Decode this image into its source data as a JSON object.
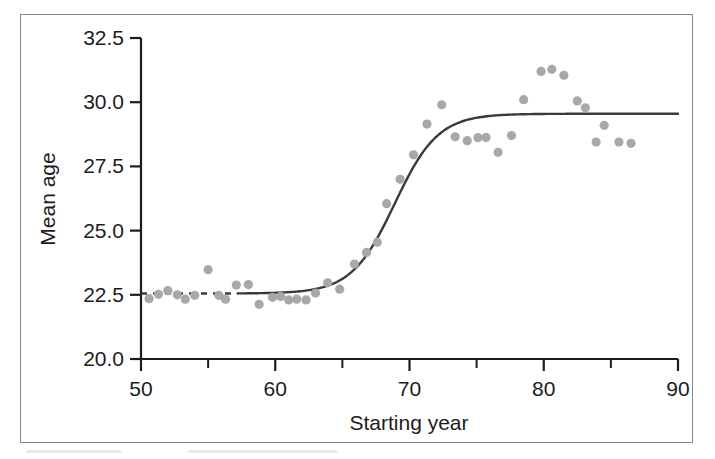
{
  "chart_data": {
    "type": "scatter",
    "title": "",
    "xlabel": "Starting year",
    "ylabel": "Mean age",
    "xlim": [
      50,
      90
    ],
    "ylim": [
      20.0,
      32.5
    ],
    "grid": false,
    "legend": "none",
    "x_ticks": [
      50,
      60,
      70,
      80,
      90
    ],
    "x_tick_labels": [
      "50",
      "60",
      "70",
      "80",
      "90"
    ],
    "x_minor_ticks": [
      55,
      65,
      75,
      85
    ],
    "y_ticks": [
      20.0,
      22.5,
      25.0,
      27.5,
      30.0,
      32.5
    ],
    "y_tick_labels": [
      "20.0",
      "22.5",
      "25.0",
      "27.5",
      "30.0",
      "32.5"
    ],
    "point_color": "#a8a8a8",
    "curve_color": "#3a3a3a",
    "axis_color": "#1c1c1c",
    "series": [
      {
        "name": "Mean age at observation",
        "type": "scatter",
        "points": [
          {
            "x": 50.6,
            "y": 22.35
          },
          {
            "x": 51.3,
            "y": 22.52
          },
          {
            "x": 52.0,
            "y": 22.66
          },
          {
            "x": 52.7,
            "y": 22.5
          },
          {
            "x": 53.3,
            "y": 22.33
          },
          {
            "x": 54.0,
            "y": 22.48
          },
          {
            "x": 55.0,
            "y": 23.48
          },
          {
            "x": 55.8,
            "y": 22.48
          },
          {
            "x": 56.3,
            "y": 22.33
          },
          {
            "x": 57.1,
            "y": 22.88
          },
          {
            "x": 58.0,
            "y": 22.9
          },
          {
            "x": 58.8,
            "y": 22.13
          },
          {
            "x": 59.8,
            "y": 22.4
          },
          {
            "x": 60.4,
            "y": 22.43
          },
          {
            "x": 61.0,
            "y": 22.3
          },
          {
            "x": 61.6,
            "y": 22.33
          },
          {
            "x": 62.3,
            "y": 22.3
          },
          {
            "x": 63.0,
            "y": 22.57
          },
          {
            "x": 63.9,
            "y": 22.97
          },
          {
            "x": 64.8,
            "y": 22.72
          },
          {
            "x": 65.9,
            "y": 23.7
          },
          {
            "x": 66.8,
            "y": 24.15
          },
          {
            "x": 67.6,
            "y": 24.55
          },
          {
            "x": 68.3,
            "y": 26.05
          },
          {
            "x": 69.3,
            "y": 27.0
          },
          {
            "x": 70.3,
            "y": 27.95
          },
          {
            "x": 71.3,
            "y": 29.15
          },
          {
            "x": 72.4,
            "y": 29.9
          },
          {
            "x": 73.4,
            "y": 28.65
          },
          {
            "x": 74.3,
            "y": 28.5
          },
          {
            "x": 75.1,
            "y": 28.62
          },
          {
            "x": 75.7,
            "y": 28.63
          },
          {
            "x": 76.6,
            "y": 28.05
          },
          {
            "x": 77.6,
            "y": 28.7
          },
          {
            "x": 78.5,
            "y": 30.1
          },
          {
            "x": 79.8,
            "y": 31.2
          },
          {
            "x": 80.6,
            "y": 31.28
          },
          {
            "x": 81.5,
            "y": 31.05
          },
          {
            "x": 82.5,
            "y": 30.05
          },
          {
            "x": 83.1,
            "y": 29.78
          },
          {
            "x": 83.9,
            "y": 28.45
          },
          {
            "x": 84.5,
            "y": 29.1
          },
          {
            "x": 85.6,
            "y": 28.45
          },
          {
            "x": 86.5,
            "y": 28.4
          }
        ]
      },
      {
        "name": "Fitted logistic curve",
        "type": "line",
        "curve_model": "logistic",
        "lower_asymptote": 22.55,
        "upper_asymptote": 29.55,
        "midpoint_year": 68.9,
        "rate": 0.62,
        "dashed_from": 50,
        "dashed_to": 57.2
      }
    ]
  }
}
